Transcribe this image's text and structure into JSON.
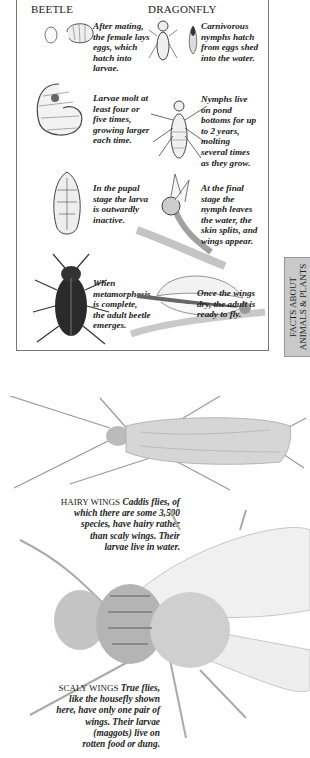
{
  "panel": {
    "columns": {
      "beetle": "BEETLE",
      "dragonfly": "DRAGONFLY"
    },
    "beetle_stages": [
      {
        "caption": [
          "After mating,",
          "the female lays",
          "eggs, which",
          "hatch into",
          "larvae."
        ]
      },
      {
        "caption": [
          "Larvae molt at",
          "least four or",
          "five times,",
          "growing larger",
          "each time."
        ]
      },
      {
        "caption": [
          "In the pupal",
          "stage the larva",
          "is outwardly",
          "inactive."
        ]
      },
      {
        "caption": [
          "When",
          "metamorphosis",
          "is complete,",
          "the adult beetle",
          "emerges."
        ]
      }
    ],
    "dragonfly_stages": [
      {
        "caption": [
          "Carnivorous",
          "nymphs hatch",
          "from eggs shed",
          "into the water."
        ]
      },
      {
        "caption": [
          "Nymphs live",
          "on pond",
          "bottoms for up",
          "to 2 years,",
          "molting",
          "several times",
          "as they grow."
        ]
      },
      {
        "caption": [
          "At the final",
          "stage the",
          "nymph leaves",
          "the water, the",
          "skin splits, and",
          "wings appear."
        ]
      },
      {
        "caption": [
          "Once the wings",
          "dry, the adult is",
          "ready to fly."
        ]
      }
    ]
  },
  "side_tab": {
    "line1": "FACTS ABOUT",
    "line2": "ANIMALS & PLANTS"
  },
  "hairy_wings": {
    "label": "HAIRY WINGS",
    "text": [
      "Caddis flies, of",
      "which there are some 3,500",
      "species, have hairy rather",
      "than scaly wings. Their",
      "larvae live in water."
    ]
  },
  "scaly_wings": {
    "label": "SCALY WINGS",
    "text": [
      "True flies,",
      "like the housefly shown",
      "here, have only one pair of",
      "wings. Their larvae",
      "(maggots) live on",
      "rotten food or dung."
    ]
  },
  "illustrations": [
    "beetle-egg",
    "beetle-larva-small",
    "beetle-larva",
    "beetle-pupa",
    "adult-beetle",
    "dragonfly-nymph-small",
    "dragonfly-egg",
    "dragonfly-nymph",
    "dragonfly-emerging",
    "adult-dragonfly",
    "caddis-fly",
    "housefly"
  ]
}
